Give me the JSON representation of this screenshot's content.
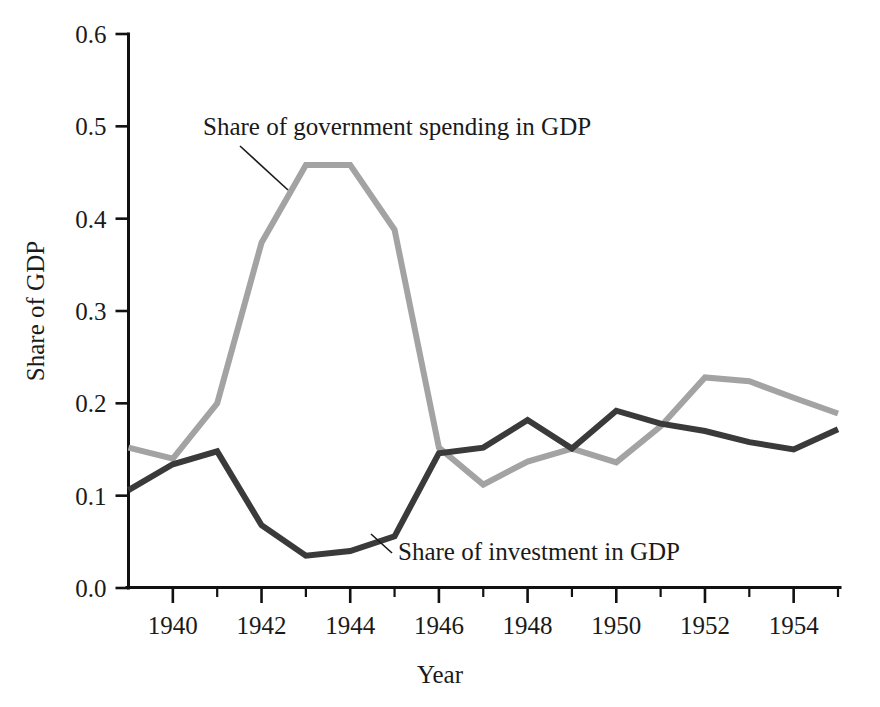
{
  "chart_data": {
    "type": "line",
    "title": "",
    "subtitle": "",
    "xlabel": "Year",
    "ylabel": "Share of GDP",
    "xlim": [
      1939,
      1955
    ],
    "ylim": [
      0.0,
      0.6
    ],
    "grid": false,
    "legend_position": "inline-annotations",
    "x": [
      1939,
      1940,
      1941,
      1942,
      1943,
      1944,
      1945,
      1946,
      1947,
      1948,
      1949,
      1950,
      1951,
      1952,
      1953,
      1954,
      1955
    ],
    "x_tick_labels": [
      "1940",
      "1942",
      "1944",
      "1946",
      "1948",
      "1950",
      "1952",
      "1954"
    ],
    "x_tick_values": [
      1940,
      1942,
      1944,
      1946,
      1948,
      1950,
      1952,
      1954
    ],
    "x_minor_tick_values": [
      1941,
      1943,
      1945,
      1947,
      1949,
      1951,
      1953,
      1955
    ],
    "y_tick_labels": [
      "0.0",
      "0.1",
      "0.2",
      "0.3",
      "0.4",
      "0.5",
      "0.6"
    ],
    "y_tick_values": [
      0.0,
      0.1,
      0.2,
      0.3,
      0.4,
      0.5,
      0.6
    ],
    "series": [
      {
        "name": "Share of government spending in GDP",
        "color": "#a3a3a3",
        "values": [
          0.152,
          0.14,
          0.2,
          0.374,
          0.458,
          0.458,
          0.388,
          0.152,
          0.112,
          0.137,
          0.151,
          0.136,
          0.175,
          0.228,
          0.224,
          0.206,
          0.189
        ]
      },
      {
        "name": "Share of investment in GDP",
        "color": "#3a3a3a",
        "values": [
          0.106,
          0.134,
          0.148,
          0.068,
          0.035,
          0.04,
          0.056,
          0.146,
          0.152,
          0.182,
          0.151,
          0.192,
          0.178,
          0.17,
          0.158,
          0.15,
          0.172
        ]
      }
    ],
    "annotations": [
      {
        "text": "Share of government spending in GDP",
        "target_series": "Share of government spending in GDP",
        "text_x": 203,
        "text_y": 135,
        "leader": [
          [
            240,
            146
          ],
          [
            288,
            190
          ]
        ]
      },
      {
        "text": "Share of investment in GDP",
        "target_series": "Share of investment in GDP",
        "text_x": 398,
        "text_y": 560,
        "leader": [
          [
            392,
            553
          ],
          [
            371,
            534
          ]
        ]
      }
    ]
  },
  "axes": {
    "y_axis_title": "Share of GDP",
    "x_axis_title": "Year"
  }
}
